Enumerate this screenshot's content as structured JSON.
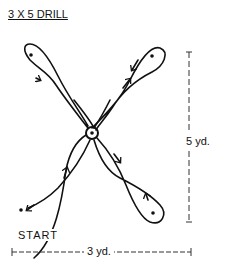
{
  "title": "3 X 5 DRILL",
  "labels": {
    "start": "START",
    "height_dimension": "5 yd.",
    "width_dimension": "3 yd."
  },
  "diagram": {
    "type": "drill-path",
    "cones": [
      {
        "name": "top-left",
        "x": 31,
        "y": 55
      },
      {
        "name": "top-right",
        "x": 152,
        "y": 56
      },
      {
        "name": "bottom-right",
        "x": 153,
        "y": 213
      },
      {
        "name": "bottom-left-start",
        "x": 21,
        "y": 210
      },
      {
        "name": "center",
        "x": 92,
        "y": 133
      }
    ],
    "stroke_color": "#111111"
  }
}
